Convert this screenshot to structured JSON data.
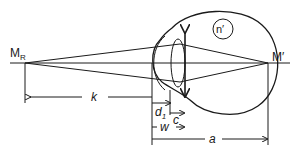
{
  "diagram": {
    "type": "optics-eye-schematic",
    "labels": {
      "far_point": "M",
      "far_point_sub": "R",
      "retina_point": "M′",
      "refractive_index": "n′",
      "k": "k",
      "d1": "d",
      "d1_sub": "1",
      "c": "c",
      "w": "w",
      "a": "a"
    },
    "colors": {
      "stroke": "#1a1a1a",
      "background": "#ffffff"
    }
  }
}
